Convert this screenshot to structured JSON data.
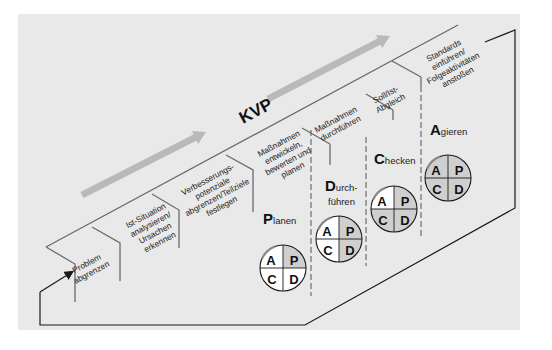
{
  "title": "KVP",
  "colors": {
    "background": "#e9e9e9",
    "line": "#1a1a1a",
    "stair_line": "#6b6b6b",
    "arrow": "#b9b9b9",
    "quadrant_done": "#cfcfcf",
    "quadrant_open": "#ffffff"
  },
  "steps": [
    {
      "lines": [
        "Problem",
        "abgrenzen"
      ]
    },
    {
      "lines": [
        "Ist-Situation",
        "analysieren/",
        "Ursachen",
        "erkennen"
      ]
    },
    {
      "lines": [
        "Verbesserungs-",
        "potenziale",
        "abgrenzen/Teilziele",
        "festlegen"
      ]
    },
    {
      "lines": [
        "Maßnahmen",
        "entwickeln,",
        "bewerten und",
        "planen"
      ]
    },
    {
      "lines": [
        "Maßnahmen",
        "durchführen"
      ]
    },
    {
      "lines": [
        "Soll/Ist-",
        "Abgleich"
      ]
    },
    {
      "lines": [
        "Standards",
        "einführen/",
        "Folgeaktivitäten",
        "anstoßen"
      ]
    }
  ],
  "phases": [
    {
      "initial": "P",
      "rest": "lanen",
      "line2": "",
      "shaded": [
        "P"
      ]
    },
    {
      "initial": "D",
      "rest": "urch-",
      "line2": "führen",
      "shaded": [
        "P",
        "D"
      ]
    },
    {
      "initial": "C",
      "rest": "hecken",
      "line2": "",
      "shaded": [
        "P",
        "D",
        "C"
      ]
    },
    {
      "initial": "A",
      "rest": "gieren",
      "line2": "",
      "shaded": [
        "P",
        "D",
        "C",
        "A"
      ]
    }
  ],
  "pdca_letters": {
    "top_left": "A",
    "top_right": "P",
    "bottom_left": "C",
    "bottom_right": "D"
  }
}
